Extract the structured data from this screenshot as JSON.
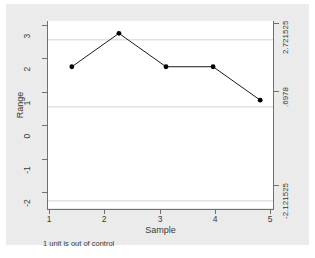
{
  "chart_data": {
    "type": "line",
    "title": "",
    "subtitle": "",
    "xlabel": "Sample",
    "ylabel": "Range",
    "x": [
      1,
      2,
      3,
      4,
      5
    ],
    "values": [
      2,
      3,
      2,
      2,
      1
    ],
    "series": [
      {
        "name": "Range",
        "values": [
          2,
          3,
          2,
          2,
          1
        ]
      }
    ],
    "xlim": [
      0.6,
      5.4
    ],
    "ylim": [
      -2.35,
      3.25
    ],
    "xticks": [
      "1",
      "2",
      "3",
      "4",
      "5"
    ],
    "yticks": [
      "3",
      "2",
      "1",
      "0",
      "-1",
      "-2"
    ],
    "ytickvalues": [
      3,
      2,
      1,
      0,
      -1,
      -2
    ],
    "grid": false,
    "legend": "none",
    "marker": "filled-circle",
    "line_color": "#1a1a1a",
    "marker_color": "#000000",
    "plot_background": "#ffffff",
    "graph_background": "#ebebeb",
    "reference_lines": [
      {
        "name": "upper-control-limit",
        "label": "2.721525",
        "value": 2.721525
      },
      {
        "name": "center-line",
        "label": ".6978",
        "value": 0.6978
      },
      {
        "name": "lower-control-limit",
        "label": "-2.121525",
        "value": -2.121525
      }
    ],
    "annotation": "1 unit is out of control"
  },
  "axes": {
    "y_title": "Range",
    "x_title": "Sample",
    "y_ticks": [
      {
        "label": "3"
      },
      {
        "label": "2"
      },
      {
        "label": "1"
      },
      {
        "label": "0"
      },
      {
        "label": "-1"
      },
      {
        "label": "-2"
      }
    ],
    "x_ticks": [
      {
        "label": "1"
      },
      {
        "label": "2"
      },
      {
        "label": "3"
      },
      {
        "label": "4"
      },
      {
        "label": "5"
      }
    ],
    "y2_ticks": [
      {
        "label": "2.721525"
      },
      {
        "label": ".6978"
      },
      {
        "label": "-2.121525"
      }
    ]
  },
  "footnote": {
    "text": "1 unit is out of control"
  }
}
